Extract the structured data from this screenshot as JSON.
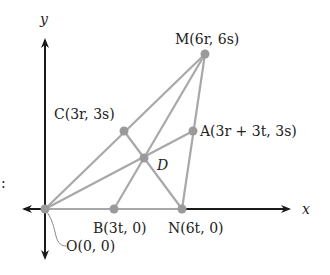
{
  "diagram": {
    "type": "coordinate-geometry",
    "axes": {
      "x_label": "x",
      "y_label": "y"
    },
    "points": {
      "O": {
        "name": "O",
        "coords": "(0, 0)",
        "label": "O(0, 0)",
        "px": [
          45,
          209
        ]
      },
      "B": {
        "name": "B",
        "coords": "(3t, 0)",
        "label": "B(3t, 0)",
        "px": [
          114,
          209
        ]
      },
      "N": {
        "name": "N",
        "coords": "(6t, 0)",
        "label": "N(6t, 0)",
        "px": [
          182,
          209
        ]
      },
      "C": {
        "name": "C",
        "coords": "(3r, 3s)",
        "label": "C(3r, 3s)",
        "px": [
          124,
          131
        ]
      },
      "A": {
        "name": "A",
        "coords": "(3r + 3t, 3s)",
        "label": "A(3r + 3t, 3s)",
        "px": [
          193,
          131
        ]
      },
      "M": {
        "name": "M",
        "coords": "(6r, 6s)",
        "label": "M(6r, 6s)",
        "px": [
          205,
          54
        ]
      },
      "D": {
        "name": "D",
        "label": "D",
        "px": [
          144,
          158
        ]
      }
    },
    "segments": [
      [
        "O",
        "M"
      ],
      [
        "O",
        "N"
      ],
      [
        "M",
        "N"
      ],
      [
        "O",
        "A"
      ],
      [
        "M",
        "B"
      ],
      [
        "N",
        "C"
      ]
    ],
    "side_mark": ":",
    "colors": {
      "axis": "#1a1a1a",
      "segment": "#a8a8a8",
      "point": "#9a9a9a",
      "text": "#222222"
    }
  }
}
